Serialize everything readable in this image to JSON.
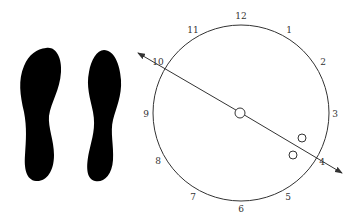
{
  "figure": {
    "footprints": [
      {
        "side": "left",
        "color": "#000000"
      },
      {
        "side": "right",
        "color": "#000000"
      }
    ],
    "clock": {
      "center": [
        241,
        113
      ],
      "radius": 88,
      "stroke": "#333333",
      "labels": [
        {
          "text": "12",
          "x": 241,
          "y": 19
        },
        {
          "text": "1",
          "x": 289,
          "y": 33
        },
        {
          "text": "2",
          "x": 323,
          "y": 65
        },
        {
          "text": "3",
          "x": 335,
          "y": 117
        },
        {
          "text": "4",
          "x": 322,
          "y": 165
        },
        {
          "text": "5",
          "x": 288,
          "y": 200
        },
        {
          "text": "6",
          "x": 241,
          "y": 212
        },
        {
          "text": "7",
          "x": 193,
          "y": 200
        },
        {
          "text": "8",
          "x": 158,
          "y": 164
        },
        {
          "text": "9",
          "x": 146,
          "y": 117
        },
        {
          "text": "10",
          "x": 158,
          "y": 65
        },
        {
          "text": "11",
          "x": 193,
          "y": 33
        }
      ],
      "axis_line": {
        "from": [
          138,
          53
        ],
        "to": [
          342,
          173
        ],
        "arrows": "both"
      },
      "markers": [
        {
          "cx": 240,
          "cy": 113,
          "r": 5,
          "label": "center-marker"
        },
        {
          "cx": 302,
          "cy": 138,
          "r": 4,
          "label": "marker-a"
        },
        {
          "cx": 293,
          "cy": 155,
          "r": 4,
          "label": "marker-b"
        }
      ]
    }
  }
}
